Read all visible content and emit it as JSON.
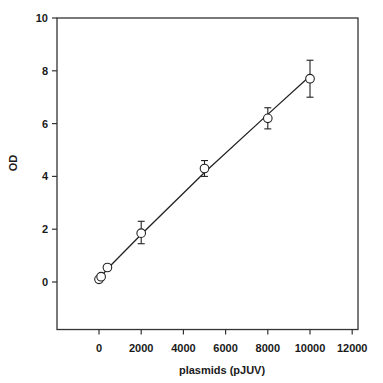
{
  "chart_data": {
    "type": "scatter",
    "title": "",
    "xlabel": "plasmids (pJUV)",
    "ylabel": "OD",
    "xlim": [
      -2000,
      12000
    ],
    "ylim": [
      -1.8,
      10
    ],
    "xticks": [
      0,
      2000,
      4000,
      6000,
      8000,
      10000,
      12000
    ],
    "yticks": [
      0,
      2,
      4,
      6,
      8,
      10
    ],
    "xtick_labels": [
      "0",
      "2000",
      "4000",
      "6000",
      "8000",
      "10000",
      "12000"
    ],
    "ytick_labels": [
      "0",
      "2",
      "4",
      "6",
      "8",
      "10"
    ],
    "grid": false,
    "legend": null,
    "marker": "open-circle",
    "fit_line": true,
    "series": [
      {
        "name": "OD",
        "x": [
          0,
          100,
          400,
          2000,
          5000,
          8000,
          10000
        ],
        "y": [
          0.1,
          0.2,
          0.55,
          1.85,
          4.3,
          6.2,
          7.7
        ],
        "yerr_low": [
          0,
          0,
          0,
          0.4,
          0.3,
          0.4,
          0.7
        ],
        "yerr_high": [
          0,
          0,
          0,
          0.45,
          0.3,
          0.4,
          0.7
        ]
      }
    ],
    "fit": {
      "x": [
        0,
        400,
        2000,
        5000,
        8000,
        10000
      ],
      "y": [
        0.1,
        0.5,
        1.8,
        4.15,
        6.35,
        7.8
      ]
    }
  }
}
